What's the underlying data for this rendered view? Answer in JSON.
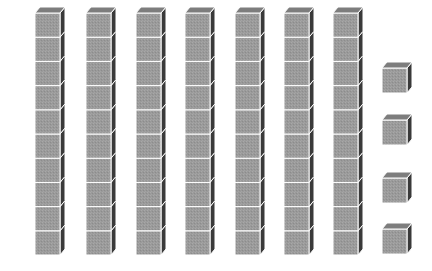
{
  "diagram": {
    "tens_rods": {
      "count": 7,
      "cubes_per_rod": 10,
      "front_x": [
        35,
        86,
        136,
        185,
        235,
        284,
        333
      ]
    },
    "units": {
      "count": 4,
      "front_x": 382,
      "front_top_y": [
        68,
        120,
        178,
        229
      ]
    },
    "represented_value": 74,
    "colors": {
      "front": "#9a9a9a",
      "top": "#7d7d7d",
      "side": "#3a3a3a",
      "edge": "#ffffff",
      "background": "#ffffff"
    }
  }
}
